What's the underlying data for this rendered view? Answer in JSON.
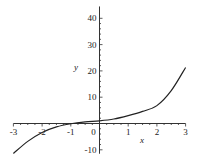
{
  "chart_data": {
    "type": "line",
    "title": "",
    "xlabel": "x",
    "ylabel": "y",
    "xlim": [
      -3,
      3
    ],
    "ylim": [
      -10,
      40
    ],
    "xticks": [
      -3,
      -2,
      -1,
      0,
      1,
      2,
      3
    ],
    "yticks": [
      -10,
      10,
      20,
      30,
      40
    ],
    "grid": false,
    "legend": null,
    "series": [
      {
        "name": "curve",
        "x": [
          -3,
          -2.5,
          -2,
          -1.5,
          -1,
          -0.5,
          0,
          0.5,
          1,
          1.5,
          2,
          2.5,
          3
        ],
        "y": [
          -11.4,
          -6.8,
          -3.4,
          -1.3,
          -0.1,
          0.6,
          1.0,
          1.7,
          3.0,
          4.6,
          6.8,
          12.5,
          21.3
        ]
      }
    ],
    "colors": {
      "axis": "#333333",
      "line": "#222222"
    }
  }
}
